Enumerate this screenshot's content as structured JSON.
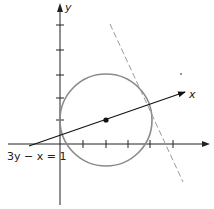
{
  "diagram": {
    "axes": {
      "x_label": "x",
      "y_label": "y",
      "x_ticks": 5,
      "y_ticks": 5
    },
    "rotated_axis_label": "x",
    "equation_label": "3y − x = 1",
    "colors": {
      "axis": "#222222",
      "circle": "#8a8a8a",
      "dashed_line": "#9a9a9a",
      "line": "#111111"
    },
    "elements": [
      {
        "type": "circle",
        "center": [
          2,
          1
        ],
        "radius": 2.1,
        "description": "gray circle centered on the line"
      },
      {
        "type": "point",
        "at": [
          2,
          1
        ],
        "description": "center point"
      },
      {
        "type": "line",
        "equation": "3y - x = 1",
        "arrow": true
      },
      {
        "type": "dashed-line",
        "description": "tangent-like dashed line crossing circle"
      }
    ]
  }
}
